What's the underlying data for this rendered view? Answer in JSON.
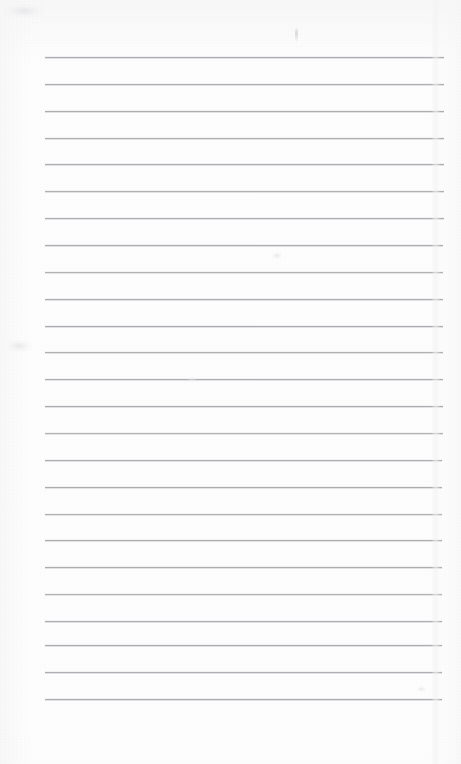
{
  "document": {
    "type": "scanned-blank-ruled-page",
    "title": "Blank ruled notebook page (scan)",
    "page_text": "",
    "has_handwriting": "no",
    "background_color": "#fdfdfd",
    "page_width": 461,
    "page_height": 764
  },
  "ruling": {
    "label": "Horizontal rule lines",
    "line_color": "#a9a9ad",
    "line_count": 25,
    "line_thickness_px": 1,
    "spacing_px": 26.8,
    "left_margin_px": 45,
    "right_margin_px": 444,
    "first_line_y": 57,
    "last_line_y": 699,
    "lines": [
      {
        "y": 57,
        "x1": 45,
        "x2": 444,
        "opacity": 0.95
      },
      {
        "y": 84,
        "x1": 45,
        "x2": 444,
        "opacity": 0.92
      },
      {
        "y": 111,
        "x1": 45,
        "x2": 444,
        "opacity": 0.95
      },
      {
        "y": 138,
        "x1": 45,
        "x2": 444,
        "opacity": 0.93
      },
      {
        "y": 164,
        "x1": 45,
        "x2": 444,
        "opacity": 0.95
      },
      {
        "y": 191,
        "x1": 45,
        "x2": 444,
        "opacity": 0.9
      },
      {
        "y": 218,
        "x1": 45,
        "x2": 444,
        "opacity": 0.93
      },
      {
        "y": 245,
        "x1": 45,
        "x2": 443,
        "opacity": 0.95
      },
      {
        "y": 272,
        "x1": 45,
        "x2": 443,
        "opacity": 0.88
      },
      {
        "y": 299,
        "x1": 45,
        "x2": 443,
        "opacity": 0.93
      },
      {
        "y": 326,
        "x1": 45,
        "x2": 443,
        "opacity": 0.95
      },
      {
        "y": 352,
        "x1": 45,
        "x2": 443,
        "opacity": 0.9
      },
      {
        "y": 379,
        "x1": 45,
        "x2": 443,
        "opacity": 0.93
      },
      {
        "y": 406,
        "x1": 45,
        "x2": 443,
        "opacity": 0.95
      },
      {
        "y": 433,
        "x1": 45,
        "x2": 443,
        "opacity": 0.88
      },
      {
        "y": 460,
        "x1": 45,
        "x2": 442,
        "opacity": 0.93
      },
      {
        "y": 487,
        "x1": 45,
        "x2": 442,
        "opacity": 0.95
      },
      {
        "y": 514,
        "x1": 45,
        "x2": 442,
        "opacity": 0.9
      },
      {
        "y": 540,
        "x1": 45,
        "x2": 442,
        "opacity": 0.93
      },
      {
        "y": 567,
        "x1": 45,
        "x2": 442,
        "opacity": 0.95
      },
      {
        "y": 594,
        "x1": 45,
        "x2": 442,
        "opacity": 0.88
      },
      {
        "y": 621,
        "x1": 45,
        "x2": 442,
        "opacity": 0.93
      },
      {
        "y": 645,
        "x1": 45,
        "x2": 442,
        "opacity": 0.95
      },
      {
        "y": 672,
        "x1": 45,
        "x2": 442,
        "opacity": 0.92
      },
      {
        "y": 699,
        "x1": 45,
        "x2": 442,
        "opacity": 0.95
      }
    ]
  },
  "artifacts": {
    "fold_seam": {
      "label": "vertical scan fold seam",
      "x": 431,
      "width": 10
    },
    "smudges": [
      {
        "label": "faint vertical pencil mark",
        "kind": "vertical",
        "x": 295,
        "y": 27,
        "w": 3,
        "h": 15
      },
      {
        "label": "faint smudge below mid line",
        "kind": "blob",
        "x": 272,
        "y": 252,
        "w": 10,
        "h": 7
      },
      {
        "label": "faint corner shading",
        "kind": "blob",
        "x": 6,
        "y": 340,
        "w": 26,
        "h": 12
      },
      {
        "label": "faint lower-right speck",
        "kind": "blob",
        "x": 417,
        "y": 686,
        "w": 9,
        "h": 6
      },
      {
        "label": "faint upper-left shading",
        "kind": "blob",
        "x": 4,
        "y": 4,
        "w": 40,
        "h": 14
      },
      {
        "label": "faint mid-page speck",
        "kind": "blob",
        "x": 188,
        "y": 377,
        "w": 8,
        "h": 5
      }
    ]
  }
}
